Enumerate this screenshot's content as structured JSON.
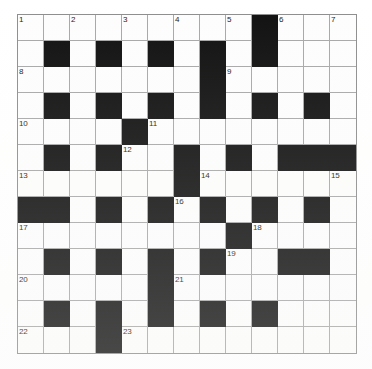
{
  "puzzle": {
    "title": "Crossword Grid",
    "type": "crossword",
    "rows": 13,
    "cols": 13,
    "cell_size_px": 26,
    "colors": {
      "block": "#111111",
      "open": "#fdfdfd",
      "grid_line": "#a8a8a8",
      "border": "#8e8e8e",
      "number_text": "#1b1b1b"
    },
    "legend": {
      "block_char": "#",
      "open_char": "."
    },
    "grid": [
      "........#...",
      ".............",
      ".............",
      ".............",
      ".............",
      ".............",
      ".............",
      ".............",
      ".............",
      ".............",
      ".............",
      ".............",
      "............."
    ],
    "layout": [
      [
        ".",
        ".",
        ".",
        ".",
        ".",
        ".",
        ".",
        ".",
        ".",
        "#",
        ".",
        ".",
        "."
      ],
      [
        ".",
        "#",
        ".",
        "#",
        ".",
        "#",
        ".",
        "#",
        ".",
        "#",
        ".",
        ".",
        "."
      ],
      [
        ".",
        ".",
        ".",
        ".",
        ".",
        ".",
        ".",
        "#",
        ".",
        ".",
        ".",
        ".",
        "."
      ],
      [
        ".",
        "#",
        ".",
        "#",
        ".",
        "#",
        ".",
        "#",
        ".",
        "#",
        ".",
        "#",
        "."
      ],
      [
        ".",
        ".",
        ".",
        ".",
        "#",
        ".",
        ".",
        ".",
        ".",
        ".",
        ".",
        ".",
        "."
      ],
      [
        ".",
        "#",
        ".",
        "#",
        ".",
        ".",
        "#",
        ".",
        "#",
        ".",
        "#",
        "#",
        "#"
      ],
      [
        ".",
        ".",
        ".",
        ".",
        ".",
        ".",
        "#",
        ".",
        ".",
        ".",
        ".",
        ".",
        "."
      ],
      [
        "#",
        "#",
        ".",
        "#",
        ".",
        "#",
        ".",
        "#",
        ".",
        "#",
        ".",
        "#",
        "."
      ],
      [
        ".",
        ".",
        ".",
        ".",
        ".",
        ".",
        ".",
        ".",
        "#",
        ".",
        ".",
        ".",
        "."
      ],
      [
        ".",
        "#",
        ".",
        "#",
        ".",
        "#",
        ".",
        "#",
        ".",
        ".",
        "#",
        "#",
        "."
      ],
      [
        ".",
        ".",
        ".",
        ".",
        ".",
        "#",
        ".",
        ".",
        ".",
        ".",
        ".",
        ".",
        "."
      ],
      [
        ".",
        "#",
        ".",
        "#",
        ".",
        "#",
        ".",
        "#",
        ".",
        "#",
        ".",
        ".",
        "."
      ],
      [
        ".",
        ".",
        ".",
        "#",
        ".",
        ".",
        ".",
        ".",
        ".",
        ".",
        ".",
        ".",
        "."
      ]
    ],
    "numbers": [
      {
        "n": "1",
        "row": 0,
        "col": 0
      },
      {
        "n": "2",
        "row": 0,
        "col": 2
      },
      {
        "n": "3",
        "row": 0,
        "col": 4
      },
      {
        "n": "4",
        "row": 0,
        "col": 6
      },
      {
        "n": "5",
        "row": 0,
        "col": 8
      },
      {
        "n": "6",
        "row": 0,
        "col": 10
      },
      {
        "n": "7",
        "row": 0,
        "col": 12
      },
      {
        "n": "8",
        "row": 2,
        "col": 0
      },
      {
        "n": "9",
        "row": 2,
        "col": 8
      },
      {
        "n": "10",
        "row": 4,
        "col": 0
      },
      {
        "n": "11",
        "row": 4,
        "col": 5
      },
      {
        "n": "12",
        "row": 5,
        "col": 4
      },
      {
        "n": "13",
        "row": 6,
        "col": 0
      },
      {
        "n": "14",
        "row": 6,
        "col": 7
      },
      {
        "n": "15",
        "row": 6,
        "col": 12
      },
      {
        "n": "16",
        "row": 7,
        "col": 6
      },
      {
        "n": "17",
        "row": 8,
        "col": 0
      },
      {
        "n": "18",
        "row": 8,
        "col": 9
      },
      {
        "n": "19",
        "row": 9,
        "col": 8
      },
      {
        "n": "20",
        "row": 10,
        "col": 0
      },
      {
        "n": "21",
        "row": 10,
        "col": 6
      },
      {
        "n": "22",
        "row": 12,
        "col": 0
      },
      {
        "n": "23",
        "row": 12,
        "col": 4
      }
    ],
    "entries": []
  }
}
